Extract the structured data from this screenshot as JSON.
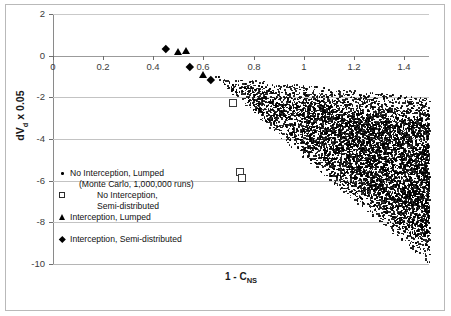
{
  "chart_data": {
    "type": "scatter",
    "title": "",
    "xlabel": "1 - C_NS",
    "xlabel_main": "1 - C",
    "xlabel_sub": "NS",
    "ylabel": "dVd x 0.05",
    "ylabel_pre": "dV",
    "ylabel_sub": "d",
    "ylabel_post": " x  0.05",
    "xlim": [
      0,
      1.5
    ],
    "ylim": [
      -10,
      2
    ],
    "xticks": [
      0,
      0.2,
      0.4,
      0.6,
      0.8,
      1,
      1.2,
      1.4
    ],
    "xtick_labels": [
      "0",
      "0.2",
      "0.4",
      "0.6",
      "0.8",
      "1",
      "1.2",
      "1.4"
    ],
    "yticks": [
      2,
      0,
      -2,
      -4,
      -6,
      -8,
      -10
    ],
    "ytick_labels": [
      "2",
      "0",
      "-2",
      "-4",
      "-6",
      "-8",
      "-10"
    ],
    "grid": "horizontal",
    "legend_position": "inside-lower-left",
    "series": [
      {
        "name": "No Interception, Lumped",
        "sublabel": "(Monte Carlo, 1,000,000 runs)",
        "marker": "dot",
        "count_label": "1,000,000 runs",
        "description": "dense wedge-shaped Monte Carlo cloud spanning x from about 0.65 to 1.5 and y from about -1 down to -10"
      },
      {
        "name": "No Interception, Semi-distributed",
        "name_line1": "No Interception,",
        "name_line2": "Semi-distributed",
        "marker": "open-square",
        "points": [
          {
            "x": 0.72,
            "y": -2.25
          },
          {
            "x": 0.745,
            "y": -5.6
          },
          {
            "x": 0.755,
            "y": -5.85
          }
        ]
      },
      {
        "name": "Interception, Lumped",
        "marker": "filled-triangle",
        "points": [
          {
            "x": 0.5,
            "y": 0.22
          },
          {
            "x": 0.53,
            "y": 0.27
          },
          {
            "x": 0.6,
            "y": -0.92
          }
        ]
      },
      {
        "name": "Interception, Semi-distributed",
        "marker": "filled-diamond",
        "points": [
          {
            "x": 0.45,
            "y": 0.33
          },
          {
            "x": 0.545,
            "y": -0.55
          },
          {
            "x": 0.63,
            "y": -1.15
          }
        ]
      }
    ],
    "colors": {
      "marker": "#000000",
      "grid": "#c3c3c3",
      "axis": "#8a8a8a",
      "text": "#1a1a1a",
      "background": "#ffffff"
    }
  },
  "legend": {
    "rows": [
      {
        "marker": "dot",
        "text": "No Interception, Lumped",
        "indent": "none"
      },
      {
        "marker": "none",
        "text": "(Monte Carlo, 1,000,000 runs)",
        "indent": "indented"
      },
      {
        "marker": "open-square",
        "text": "No Interception,",
        "indent": "indented2"
      },
      {
        "marker": "none",
        "text": "Semi-distributed",
        "indent": "indented2"
      },
      {
        "marker": "filled-triangle",
        "text": "Interception, Lumped",
        "indent": "none"
      },
      {
        "marker": "none",
        "text": "",
        "indent": "none"
      },
      {
        "marker": "filled-diamond",
        "text": "Interception, Semi-distributed",
        "indent": "none"
      }
    ]
  }
}
